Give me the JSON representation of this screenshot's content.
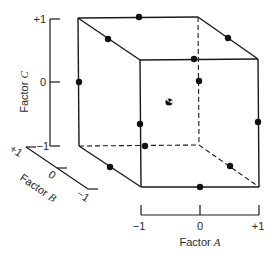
{
  "diagram": {
    "colors": {
      "ink": "#1a1a1a",
      "background": "#ffffff"
    },
    "axes": {
      "A": {
        "name_prefix": "Factor ",
        "name_var": "A",
        "ticks": [
          "−1",
          "0",
          "+1"
        ]
      },
      "B": {
        "name_prefix": "Factor ",
        "name_var": "B",
        "ticks": [
          "+1",
          "0",
          "−1"
        ]
      },
      "C": {
        "name_prefix": "Factor ",
        "name_var": "C",
        "ticks": [
          "+1",
          "0",
          "−1"
        ]
      }
    },
    "cube": {
      "front_face": {
        "top_left": [
          140,
          60
        ],
        "top_right": [
          258,
          59
        ],
        "bottom_left": [
          141,
          187
        ],
        "bottom_right": [
          259,
          187
        ]
      },
      "back_face": {
        "top_left": [
          78,
          18
        ],
        "top_right": [
          198,
          17
        ],
        "bottom_left": [
          79,
          146
        ],
        "bottom_right": [
          199,
          145
        ]
      },
      "hidden_edges": "dashed"
    },
    "design_points": [
      {
        "id": "back-top-center",
        "x": 139,
        "y": 17
      },
      {
        "id": "top-left-edge-mid",
        "x": 108,
        "y": 39
      },
      {
        "id": "top-right-edge-mid",
        "x": 228,
        "y": 38
      },
      {
        "id": "front-top-center",
        "x": 194,
        "y": 59
      },
      {
        "id": "back-left-mid",
        "x": 79,
        "y": 82
      },
      {
        "id": "back-right-mid",
        "x": 199,
        "y": 81
      },
      {
        "id": "front-left-mid",
        "x": 140,
        "y": 124
      },
      {
        "id": "front-right-mid",
        "x": 258,
        "y": 122
      },
      {
        "id": "back-bottom-center",
        "x": 145,
        "y": 146
      },
      {
        "id": "bottom-left-edge-mid",
        "x": 110,
        "y": 167
      },
      {
        "id": "bottom-right-edge-mid",
        "x": 230,
        "y": 166
      },
      {
        "id": "front-bottom-center",
        "x": 200,
        "y": 187
      }
    ],
    "center_point": {
      "x": 169,
      "y": 102,
      "style": "circled"
    }
  }
}
